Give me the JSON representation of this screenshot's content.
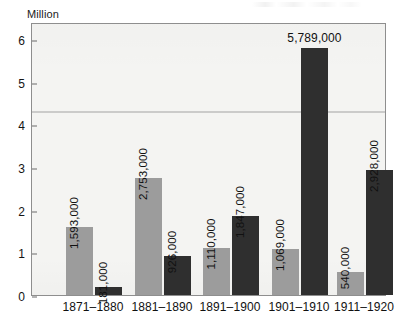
{
  "chart_data": {
    "type": "bar",
    "title": "",
    "xlabel": "",
    "ylabel": "Million",
    "ylim": [
      0,
      6.4
    ],
    "yticks": [
      0,
      1,
      2,
      3,
      4,
      5,
      6
    ],
    "ytick_labels": [
      "0",
      "1",
      "2",
      "3",
      "4",
      "5",
      "6"
    ],
    "grid": false,
    "legend": "none",
    "categories": [
      "1871–1880",
      "1881–1890",
      "1891–1900",
      "1901–1910",
      "1911–1920"
    ],
    "series": [
      {
        "name": "light",
        "color": "#9c9c9c",
        "values": [
          1593000,
          2753000,
          1110000,
          1069000,
          540000
        ],
        "value_labels": [
          "1,593,000",
          "2,753,000",
          "1,110,000",
          "1,069,000",
          "540,000"
        ],
        "label_orientation": [
          "vertical",
          "vertical",
          "vertical",
          "vertical",
          "vertical"
        ]
      },
      {
        "name": "dark",
        "color": "#2f2f2f",
        "values": [
          181000,
          926000,
          1847000,
          5789000,
          2928000
        ],
        "value_labels": [
          "181,000",
          "926,000",
          "1,847,000",
          "5,789,000",
          "2,928,000"
        ],
        "label_orientation": [
          "vertical",
          "vertical",
          "vertical",
          "horizontal",
          "vertical"
        ]
      }
    ]
  },
  "colors": {
    "light_bar": "#9c9c9c",
    "dark_bar": "#2f2f2f",
    "plot_background": "#f4f4f2",
    "frame": "#8e8e8e",
    "text": "#111111"
  }
}
